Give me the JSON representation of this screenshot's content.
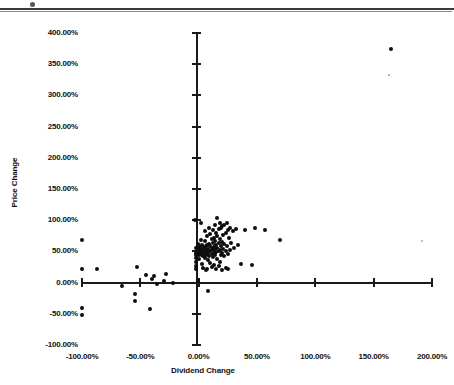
{
  "figure": {
    "background_color": "#ffffff",
    "ink_color": "#111111",
    "marker_color": "#0d0d0d"
  },
  "axis_titles": {
    "x": "Dividend Change",
    "y": "Price Change"
  },
  "x_tick_labels": [
    "-100.00%",
    "-50.00%",
    "0.00%",
    "50.00%",
    "100.00%",
    "150.00%",
    "200.00%"
  ],
  "y_tick_labels": [
    "400.00%",
    "350.00%",
    "300.00%",
    "250.00%",
    "200.00%",
    "150.00%",
    "100.00%",
    "50.00%",
    "0.00%",
    "-50.00%",
    "-100.00%"
  ],
  "chart_data": {
    "type": "scatter",
    "title": "",
    "xlabel": "Dividend Change",
    "ylabel": "Price Change",
    "xlim": [
      -100,
      200
    ],
    "ylim": [
      -100,
      400
    ],
    "xticks": [
      -100,
      -50,
      0,
      50,
      100,
      150,
      200
    ],
    "yticks": [
      -100,
      -50,
      0,
      50,
      100,
      150,
      200,
      250,
      300,
      350,
      400
    ],
    "xtick_format": "percent",
    "ytick_format": "percent",
    "grid": false,
    "legend": false,
    "marker": "filled-circle",
    "series": [
      {
        "name": "Companies",
        "points": [
          [
            165,
            375
          ],
          [
            -100,
            68
          ],
          [
            -100,
            22
          ],
          [
            -100,
            -40
          ],
          [
            -100,
            -52
          ],
          [
            -87,
            22
          ],
          [
            -66,
            -5
          ],
          [
            -53,
            25
          ],
          [
            -55,
            -18
          ],
          [
            -55,
            -30
          ],
          [
            -45,
            12
          ],
          [
            -42,
            -42
          ],
          [
            -40,
            5
          ],
          [
            -38,
            10
          ],
          [
            -36,
            -2
          ],
          [
            -30,
            2
          ],
          [
            -28,
            14
          ],
          [
            -22,
            0
          ],
          [
            -3,
            100
          ],
          [
            -2,
            55
          ],
          [
            -2,
            48
          ],
          [
            -2,
            44
          ],
          [
            -2,
            40
          ],
          [
            -2,
            33
          ],
          [
            -2,
            27
          ],
          [
            -2,
            22
          ],
          [
            -1,
            62
          ],
          [
            -1,
            52
          ],
          [
            -1,
            46
          ],
          [
            -1,
            2
          ],
          [
            0,
            58
          ],
          [
            0,
            50
          ],
          [
            0,
            44
          ],
          [
            0,
            38
          ],
          [
            1,
            56
          ],
          [
            1,
            49
          ],
          [
            2,
            96
          ],
          [
            2,
            68
          ],
          [
            2,
            53
          ],
          [
            2,
            47
          ],
          [
            3,
            61
          ],
          [
            3,
            52
          ],
          [
            3,
            44
          ],
          [
            3,
            30
          ],
          [
            4,
            57
          ],
          [
            4,
            50
          ],
          [
            4,
            42
          ],
          [
            4,
            24
          ],
          [
            5,
            82
          ],
          [
            5,
            66
          ],
          [
            5,
            55
          ],
          [
            5,
            48
          ],
          [
            5,
            40
          ],
          [
            6,
            58
          ],
          [
            6,
            51
          ],
          [
            6,
            45
          ],
          [
            6,
            20
          ],
          [
            7,
            75
          ],
          [
            7,
            60
          ],
          [
            7,
            53
          ],
          [
            7,
            46
          ],
          [
            7,
            22
          ],
          [
            8,
            -14
          ],
          [
            8,
            54
          ],
          [
            8,
            48
          ],
          [
            8,
            36
          ],
          [
            9,
            88
          ],
          [
            9,
            62
          ],
          [
            9,
            51
          ],
          [
            9,
            43
          ],
          [
            10,
            78
          ],
          [
            10,
            58
          ],
          [
            10,
            50
          ],
          [
            10,
            31
          ],
          [
            11,
            70
          ],
          [
            11,
            56
          ],
          [
            11,
            46
          ],
          [
            11,
            25
          ],
          [
            12,
            84
          ],
          [
            12,
            64
          ],
          [
            12,
            52
          ],
          [
            12,
            41
          ],
          [
            13,
            72
          ],
          [
            13,
            57
          ],
          [
            13,
            47
          ],
          [
            13,
            28
          ],
          [
            14,
            92
          ],
          [
            14,
            66
          ],
          [
            14,
            54
          ],
          [
            14,
            44
          ],
          [
            15,
            80
          ],
          [
            15,
            60
          ],
          [
            15,
            49
          ],
          [
            15,
            22
          ],
          [
            16,
            103
          ],
          [
            16,
            74
          ],
          [
            16,
            55
          ],
          [
            16,
            38
          ],
          [
            17,
            86
          ],
          [
            17,
            63
          ],
          [
            17,
            50
          ],
          [
            17,
            26
          ],
          [
            18,
            95
          ],
          [
            18,
            70
          ],
          [
            18,
            52
          ],
          [
            18,
            33
          ],
          [
            19,
            88
          ],
          [
            19,
            58
          ],
          [
            19,
            44
          ],
          [
            20,
            90
          ],
          [
            20,
            65
          ],
          [
            20,
            48
          ],
          [
            20,
            20
          ],
          [
            21,
            76
          ],
          [
            21,
            54
          ],
          [
            22,
            93
          ],
          [
            22,
            62
          ],
          [
            22,
            42
          ],
          [
            23,
            80
          ],
          [
            23,
            50
          ],
          [
            23,
            24
          ],
          [
            24,
            96
          ],
          [
            24,
            58
          ],
          [
            25,
            84
          ],
          [
            25,
            46
          ],
          [
            25,
            21
          ],
          [
            26,
            72
          ],
          [
            27,
            88
          ],
          [
            27,
            52
          ],
          [
            28,
            64
          ],
          [
            29,
            83
          ],
          [
            30,
            56
          ],
          [
            32,
            86
          ],
          [
            34,
            60
          ],
          [
            36,
            30
          ],
          [
            40,
            85
          ],
          [
            46,
            28
          ],
          [
            48,
            88
          ],
          [
            57,
            85
          ],
          [
            70,
            68
          ]
        ]
      }
    ]
  }
}
